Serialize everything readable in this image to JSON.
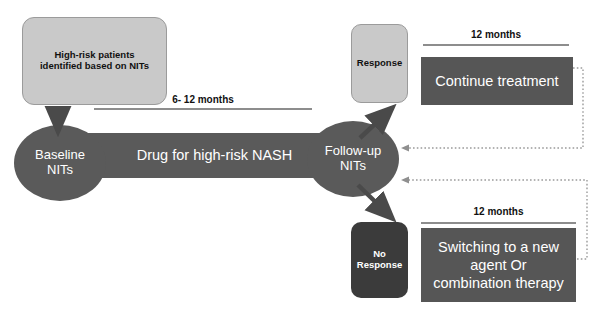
{
  "diagram": {
    "colors": {
      "light_box": "#c9c9c9",
      "dark_node": "#5a5a5a",
      "darkest_box": "#3b3b3b",
      "treatment_box": "#565656",
      "rule": "#8d8d8d",
      "arrow": "#4a4a4a",
      "dotted": "#a0a0a0",
      "text_dark": "#111111",
      "text_light": "#ffffff",
      "background": "#ffffff"
    },
    "nodes": {
      "high_risk": {
        "line1": "High-risk patients",
        "line2": "identified based on NITs"
      },
      "baseline": {
        "line1": "Baseline",
        "line2": "NITs"
      },
      "drug_bar": {
        "label": "Drug for high-risk  NASH"
      },
      "followup": {
        "line1": "Follow-up",
        "line2": "NITs"
      },
      "response": {
        "label": "Response"
      },
      "no_response": {
        "line1": "No",
        "line2": "Response"
      },
      "continue_treatment": {
        "label": "Continue treatment"
      },
      "switch_treatment": {
        "line1": "Switching to a new",
        "line2": "agent Or",
        "line3": "combination therapy"
      }
    },
    "durations": {
      "main": "6- 12 months",
      "response_arm": "12 months",
      "no_response_arm": "12 months"
    },
    "edges": [
      {
        "name": "high-risk-to-baseline",
        "style": "solid-arrow"
      },
      {
        "name": "baseline-to-followup",
        "style": "bar"
      },
      {
        "name": "followup-to-response",
        "style": "solid-arrow"
      },
      {
        "name": "followup-to-no-response",
        "style": "solid-arrow"
      },
      {
        "name": "continue-treatment-back-to-followup",
        "style": "dotted-arrow"
      },
      {
        "name": "switch-treatment-back-to-followup",
        "style": "dotted-arrow"
      }
    ]
  }
}
